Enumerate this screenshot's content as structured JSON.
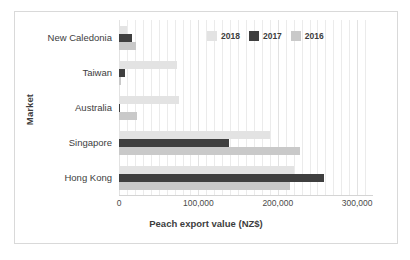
{
  "chart_data": {
    "type": "bar",
    "orientation": "horizontal",
    "title": "",
    "xlabel": "Peach export value (NZ$)",
    "ylabel": "Market",
    "categories": [
      "New Caledonia",
      "Taiwan",
      "Australia",
      "Singapore",
      "Hong Kong"
    ],
    "series": [
      {
        "name": "2018",
        "color": "#e3e3e3",
        "values": [
          10000,
          73000,
          75000,
          190000,
          220000
        ]
      },
      {
        "name": "2017",
        "color": "#3f3f3f",
        "values": [
          16000,
          8000,
          1000,
          138000,
          258000
        ]
      },
      {
        "name": "2016",
        "color": "#c9c9c9",
        "values": [
          22000,
          2000,
          23000,
          228000,
          215000
        ]
      }
    ],
    "xlim": [
      0,
      320000
    ],
    "xticks": [
      0,
      100000,
      200000,
      300000
    ],
    "xtick_labels": [
      "0",
      "100,000",
      "200,000",
      "300,000"
    ],
    "grid": true,
    "grid_axis": "x",
    "legend_position": "top-right",
    "legend_order": [
      "2018",
      "2017",
      "2016"
    ]
  },
  "colors": {
    "frame": "#d9d9d9",
    "gridline": "#ebebeb",
    "axis_line": "#d4d4d4",
    "text": "#3d3d3d",
    "series_2018": "#e3e3e3",
    "series_2017": "#3f3f3f",
    "series_2016": "#c9c9c9"
  }
}
